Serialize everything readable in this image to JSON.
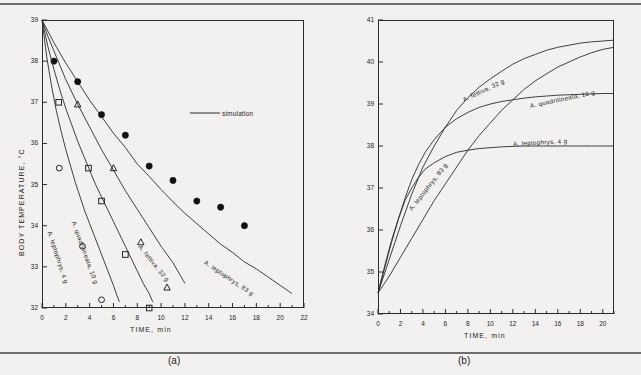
{
  "figure": {
    "panels": [
      {
        "id": "a",
        "caption": "(a)",
        "xlabel": "TIME, min",
        "ylabel": "BODY  TEMPERATURE,  °C"
      },
      {
        "id": "b",
        "caption": "(b)",
        "xlabel": "TIME, min",
        "ylabel": "BODY  TEMPERATURE,  °C"
      }
    ]
  },
  "chart_data": [
    {
      "type": "line",
      "panel": "a",
      "title": "",
      "xlabel": "TIME, min",
      "ylabel": "BODY TEMPERATURE, °C",
      "xlim": [
        0,
        22
      ],
      "ylim": [
        32,
        39
      ],
      "xticks": [
        0,
        2,
        4,
        6,
        8,
        10,
        12,
        14,
        16,
        18,
        20,
        22
      ],
      "yticks": [
        32,
        33,
        34,
        35,
        36,
        37,
        38,
        39
      ],
      "xtick_labels": [
        "0",
        "2",
        "4",
        "6",
        "8",
        "10",
        "12",
        "14",
        "16",
        "18",
        "20",
        "22"
      ],
      "ytick_labels": [
        "32",
        "33",
        "34",
        "35",
        "36",
        "37",
        "38",
        "39"
      ],
      "grid": false,
      "legend": [
        {
          "label": "simulation",
          "marker": "line"
        }
      ],
      "series": [
        {
          "name": "A. leptophrys, 83 g",
          "label": "A. leptophrys,  83 g",
          "marker": "filled-circle",
          "curve": [
            [
              0,
              39.0
            ],
            [
              1,
              38.45
            ],
            [
              2,
              37.95
            ],
            [
              3,
              37.5
            ],
            [
              4,
              37.05
            ],
            [
              5,
              36.65
            ],
            [
              6,
              36.25
            ],
            [
              7,
              35.9
            ],
            [
              8,
              35.5
            ],
            [
              9,
              35.2
            ],
            [
              10,
              34.88
            ],
            [
              11,
              34.58
            ],
            [
              12,
              34.3
            ],
            [
              13,
              34.05
            ],
            [
              14,
              33.8
            ],
            [
              15,
              33.55
            ],
            [
              16,
              33.35
            ],
            [
              17,
              33.12
            ],
            [
              18,
              32.95
            ],
            [
              19,
              32.75
            ],
            [
              20,
              32.55
            ],
            [
              21,
              32.35
            ]
          ],
          "points": [
            [
              1,
              38.0
            ],
            [
              3,
              37.5
            ],
            [
              5,
              36.7
            ],
            [
              7,
              36.2
            ],
            [
              9,
              35.45
            ],
            [
              11,
              35.1
            ],
            [
              13,
              34.6
            ],
            [
              15,
              34.45
            ],
            [
              17,
              34.0
            ]
          ]
        },
        {
          "name": "A. fettiva, 32 g",
          "label": "A. fettiva,  32 g",
          "marker": "open-triangle",
          "curve": [
            [
              0,
              39.0
            ],
            [
              0.5,
              38.6
            ],
            [
              1,
              38.25
            ],
            [
              1.5,
              37.9
            ],
            [
              2,
              37.55
            ],
            [
              3,
              36.95
            ],
            [
              4,
              36.4
            ],
            [
              5,
              35.85
            ],
            [
              6,
              35.35
            ],
            [
              7,
              34.85
            ],
            [
              8,
              34.4
            ],
            [
              9,
              33.95
            ],
            [
              10,
              33.5
            ],
            [
              11,
              33.1
            ],
            [
              11.6,
              32.8
            ],
            [
              12,
              32.6
            ]
          ],
          "points": [
            [
              3,
              36.95
            ],
            [
              6,
              35.4
            ],
            [
              8.3,
              33.6
            ],
            [
              10.5,
              32.5
            ]
          ]
        },
        {
          "name": "A. quadrilineata, 10 g",
          "label": "A. quadrilineata,  10 g",
          "marker": "open-square",
          "curve": [
            [
              0,
              39.0
            ],
            [
              0.5,
              38.35
            ],
            [
              1,
              37.8
            ],
            [
              1.5,
              37.3
            ],
            [
              2,
              36.85
            ],
            [
              2.5,
              36.45
            ],
            [
              3,
              36.05
            ],
            [
              3.5,
              35.7
            ],
            [
              4,
              35.35
            ],
            [
              4.5,
              35.0
            ],
            [
              5,
              34.7
            ],
            [
              5.5,
              34.4
            ],
            [
              6,
              34.1
            ],
            [
              6.5,
              33.8
            ],
            [
              7,
              33.5
            ],
            [
              7.5,
              33.2
            ],
            [
              8,
              32.9
            ],
            [
              8.5,
              32.6
            ],
            [
              9,
              32.35
            ],
            [
              9.3,
              32.15
            ]
          ],
          "points": [
            [
              1.4,
              37.0
            ],
            [
              3.9,
              35.4
            ],
            [
              5.0,
              34.6
            ],
            [
              7.0,
              33.3
            ],
            [
              9.0,
              32.0
            ]
          ]
        },
        {
          "name": "A. leptophrys, 4 g",
          "label": "A. leptophrys,  4 g",
          "marker": "open-circle",
          "curve": [
            [
              0,
              39.0
            ],
            [
              0.4,
              38.1
            ],
            [
              0.8,
              37.4
            ],
            [
              1.2,
              36.8
            ],
            [
              1.6,
              36.3
            ],
            [
              2,
              35.85
            ],
            [
              2.4,
              35.45
            ],
            [
              2.8,
              35.05
            ],
            [
              3.2,
              34.7
            ],
            [
              3.6,
              34.35
            ],
            [
              4,
              34.05
            ],
            [
              4.4,
              33.75
            ],
            [
              4.8,
              33.45
            ],
            [
              5.2,
              33.15
            ],
            [
              5.6,
              32.85
            ],
            [
              6,
              32.55
            ],
            [
              6.3,
              32.3
            ],
            [
              6.5,
              32.15
            ]
          ],
          "points": [
            [
              1.45,
              35.4
            ],
            [
              3.4,
              33.5
            ],
            [
              5.0,
              32.2
            ]
          ]
        }
      ]
    },
    {
      "type": "line",
      "panel": "b",
      "title": "",
      "xlabel": "TIME, min",
      "ylabel": "BODY TEMPERATURE, °C",
      "xlim": [
        0,
        21
      ],
      "ylim": [
        34,
        41
      ],
      "xticks": [
        0,
        2,
        4,
        6,
        8,
        10,
        12,
        14,
        16,
        18,
        20
      ],
      "yticks": [
        34,
        35,
        36,
        37,
        38,
        39,
        40,
        41
      ],
      "xtick_labels": [
        "0",
        "2",
        "4",
        "6",
        "8",
        "10",
        "12",
        "14",
        "16",
        "18",
        "20"
      ],
      "ytick_labels": [
        "34",
        "35",
        "36",
        "37",
        "38",
        "39",
        "40",
        "41"
      ],
      "grid": false,
      "legend": [],
      "series": [
        {
          "name": "A. fettiva, 32 g",
          "label": "A. fettiva,  32 g",
          "curve": [
            [
              0,
              34.5
            ],
            [
              1,
              35.3
            ],
            [
              2,
              36.1
            ],
            [
              3,
              36.85
            ],
            [
              4,
              37.5
            ],
            [
              5,
              38.0
            ],
            [
              6,
              38.45
            ],
            [
              7,
              38.85
            ],
            [
              8,
              39.15
            ],
            [
              9,
              39.4
            ],
            [
              10,
              39.6
            ],
            [
              11,
              39.78
            ],
            [
              12,
              39.95
            ],
            [
              13,
              40.08
            ],
            [
              14,
              40.18
            ],
            [
              15,
              40.28
            ],
            [
              16,
              40.35
            ],
            [
              17,
              40.4
            ],
            [
              18,
              40.45
            ],
            [
              19,
              40.48
            ],
            [
              20,
              40.5
            ],
            [
              21,
              40.52
            ]
          ]
        },
        {
          "name": "A. leptophrys, 83 g",
          "label": "A. leptophrys,  83 g",
          "curve": [
            [
              0,
              34.5
            ],
            [
              1,
              34.9
            ],
            [
              2,
              35.35
            ],
            [
              3,
              35.8
            ],
            [
              4,
              36.25
            ],
            [
              5,
              36.7
            ],
            [
              6,
              37.1
            ],
            [
              7,
              37.5
            ],
            [
              8,
              37.9
            ],
            [
              9,
              38.25
            ],
            [
              10,
              38.55
            ],
            [
              11,
              38.85
            ],
            [
              12,
              39.1
            ],
            [
              13,
              39.35
            ],
            [
              14,
              39.55
            ],
            [
              15,
              39.72
            ],
            [
              16,
              39.88
            ],
            [
              17,
              40.0
            ],
            [
              18,
              40.12
            ],
            [
              19,
              40.22
            ],
            [
              20,
              40.3
            ],
            [
              21,
              40.35
            ]
          ]
        },
        {
          "name": "A. quadrilineata, 10 g",
          "label": "A. quadrilineata,  10 g",
          "curve": [
            [
              0,
              34.5
            ],
            [
              0.6,
              35.1
            ],
            [
              1.2,
              35.7
            ],
            [
              1.8,
              36.25
            ],
            [
              2.4,
              36.75
            ],
            [
              3,
              37.2
            ],
            [
              3.6,
              37.55
            ],
            [
              4.2,
              37.85
            ],
            [
              5,
              38.15
            ],
            [
              6,
              38.45
            ],
            [
              7,
              38.65
            ],
            [
              8,
              38.8
            ],
            [
              9,
              38.92
            ],
            [
              10,
              39.0
            ],
            [
              11,
              39.06
            ],
            [
              12,
              39.1
            ],
            [
              13,
              39.14
            ],
            [
              14,
              39.17
            ],
            [
              15,
              39.19
            ],
            [
              16,
              39.21
            ],
            [
              17,
              39.22
            ],
            [
              18,
              39.23
            ],
            [
              19,
              39.24
            ],
            [
              20,
              39.25
            ],
            [
              21,
              39.25
            ]
          ]
        },
        {
          "name": "A. leptophrys, 4 g",
          "label": "A. leptophrys,  4 g",
          "curve": [
            [
              0,
              34.5
            ],
            [
              0.6,
              35.15
            ],
            [
              1.2,
              35.75
            ],
            [
              1.8,
              36.25
            ],
            [
              2.4,
              36.7
            ],
            [
              3,
              37.0
            ],
            [
              3.6,
              37.25
            ],
            [
              4.2,
              37.45
            ],
            [
              5,
              37.6
            ],
            [
              6,
              37.75
            ],
            [
              7,
              37.85
            ],
            [
              8,
              37.9
            ],
            [
              9,
              37.94
            ],
            [
              10,
              37.96
            ],
            [
              11,
              37.98
            ],
            [
              12,
              37.99
            ],
            [
              13,
              38.0
            ],
            [
              14,
              38.0
            ],
            [
              15,
              38.0
            ],
            [
              16,
              38.0
            ],
            [
              17,
              38.0
            ],
            [
              18,
              38.0
            ],
            [
              19,
              38.0
            ],
            [
              20,
              38.0
            ],
            [
              21,
              38.0
            ]
          ]
        }
      ]
    }
  ],
  "colors": {
    "ink": "#1c1c1c",
    "line": "#2b2b2b",
    "background": "#f2f1ef"
  }
}
